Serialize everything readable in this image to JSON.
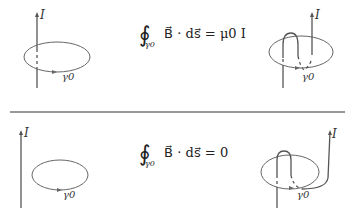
{
  "figure": {
    "top_panel": {
      "equation": {
        "integral": "∮",
        "subscript": "γ0",
        "body": "B⃗ · ds⃗ = μ0 I"
      },
      "left": {
        "current_label": "I",
        "loop_label": "γ0"
      },
      "right": {
        "current_label": "I",
        "loop_label": "γ0"
      }
    },
    "bottom_panel": {
      "equation": {
        "integral": "∮",
        "subscript": "γ0",
        "body": "B⃗ · ds⃗ = 0"
      },
      "left": {
        "current_label": "I",
        "loop_label": "γ0"
      },
      "right": {
        "current_label": "I",
        "loop_label": "γ0"
      }
    },
    "colors": {
      "line": "#555555",
      "divider": "#333333",
      "text": "#222222"
    }
  }
}
